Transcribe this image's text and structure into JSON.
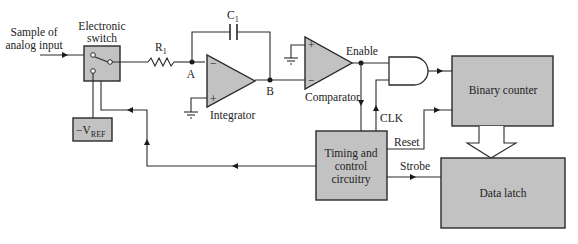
{
  "diagram": {
    "labels": {
      "input_line1": "Sample of",
      "input_line2": "analog input",
      "switch_line1": "Electronic",
      "switch_line2": "switch",
      "resistor": "R",
      "resistor_sub": "1",
      "capacitor": "C",
      "capacitor_sub": "1",
      "node_a": "A",
      "node_b": "B",
      "integrator": "Integrator",
      "comparator": "Comparator",
      "enable": "Enable",
      "clk": "CLK",
      "reset": "Reset",
      "strobe": "Strobe",
      "vref": "−V",
      "vref_sub": "REF",
      "timing_line1": "Timing and",
      "timing_line2": "control",
      "timing_line3": "circuitry",
      "binary_counter": "Binary counter",
      "data_latch": "Data latch",
      "plus": "+",
      "minus": "−"
    },
    "colors": {
      "block_fill": "#c2c2c2",
      "line": "#2a2a2a"
    }
  }
}
